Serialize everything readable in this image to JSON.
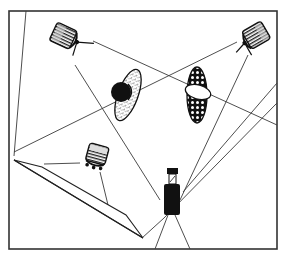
{
  "diagram": {
    "title": "",
    "type": "studio lighting setup",
    "colors": {
      "ink": "#222222",
      "line": "#3a3a3a",
      "background": "#ffffff"
    },
    "elements": [
      {
        "id": "light-top-left",
        "kind": "studio-light",
        "label": ""
      },
      {
        "id": "light-top-right",
        "kind": "studio-light",
        "label": ""
      },
      {
        "id": "light-bottom",
        "kind": "studio-light",
        "label": ""
      },
      {
        "id": "subject-left",
        "kind": "subject-with-dark-ball",
        "label": ""
      },
      {
        "id": "subject-right",
        "kind": "subject-with-white-oval",
        "label": ""
      },
      {
        "id": "camera",
        "kind": "camera",
        "label": ""
      },
      {
        "id": "reflector",
        "kind": "reflector-panel",
        "label": ""
      },
      {
        "id": "backdrop-edge",
        "kind": "wall-line",
        "label": ""
      }
    ]
  }
}
